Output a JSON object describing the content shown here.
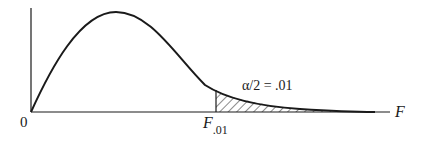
{
  "diagram": {
    "title": "",
    "distribution": "F",
    "axes": {
      "x_label": "F",
      "origin_label": "0"
    },
    "critical_value": {
      "symbol": "F",
      "subscript": ".01"
    },
    "tail_annotation": "α/2 = .01",
    "colors": {
      "ink": "#1a1a1a",
      "background": "#ffffff"
    }
  }
}
